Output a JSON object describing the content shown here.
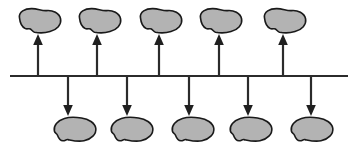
{
  "figure": {
    "title": "",
    "background_color": "#ffffff",
    "width": 360,
    "height": 150
  },
  "colors": {
    "blob_fill": "#b3b3b3",
    "blob_stroke": "#1a1a1a",
    "line_color": "#2b2b2b",
    "arrow_color": "#1f1f1f",
    "background": "#ffffff"
  },
  "axis": {
    "name": "horizontal-axis",
    "label": "",
    "x_start": 10,
    "x_end": 348,
    "y": 76,
    "thickness": 2.2
  },
  "chart_data": {
    "type": "diagram",
    "title": "",
    "xlabel": "",
    "ylabel": "",
    "grid": false,
    "legend": null,
    "nodes_above": [
      {
        "id": "above-1",
        "label": "",
        "cx": 40,
        "cy": 22,
        "rx": 21,
        "ry": 13
      },
      {
        "id": "above-2",
        "label": "",
        "cx": 100,
        "cy": 22,
        "rx": 21,
        "ry": 13
      },
      {
        "id": "above-3",
        "label": "",
        "cx": 161,
        "cy": 22,
        "rx": 21,
        "ry": 13
      },
      {
        "id": "above-4",
        "label": "",
        "cx": 221,
        "cy": 22,
        "rx": 21,
        "ry": 13
      },
      {
        "id": "above-5",
        "label": "",
        "cx": 285,
        "cy": 22,
        "rx": 21,
        "ry": 13
      }
    ],
    "nodes_below": [
      {
        "id": "below-1",
        "label": "",
        "cx": 75,
        "cy": 129,
        "rx": 21,
        "ry": 13
      },
      {
        "id": "below-2",
        "label": "",
        "cx": 132,
        "cy": 129,
        "rx": 21,
        "ry": 13
      },
      {
        "id": "below-3",
        "label": "",
        "cx": 193,
        "cy": 129,
        "rx": 21,
        "ry": 13
      },
      {
        "id": "below-4",
        "label": "",
        "cx": 251,
        "cy": 129,
        "rx": 21,
        "ry": 13
      },
      {
        "id": "below-5",
        "label": "",
        "cx": 312,
        "cy": 129,
        "rx": 21,
        "ry": 13
      }
    ],
    "arrows_up": [
      {
        "id": "arrow-up-1",
        "x": 38,
        "y_from": 76,
        "y_to": 38
      },
      {
        "id": "arrow-up-2",
        "x": 97,
        "y_from": 76,
        "y_to": 38
      },
      {
        "id": "arrow-up-3",
        "x": 159,
        "y_from": 76,
        "y_to": 38
      },
      {
        "id": "arrow-up-4",
        "x": 219,
        "y_from": 76,
        "y_to": 38
      },
      {
        "id": "arrow-up-5",
        "x": 283,
        "y_from": 76,
        "y_to": 38
      }
    ],
    "arrows_down": [
      {
        "id": "arrow-down-1",
        "x": 68,
        "y_from": 76,
        "y_to": 113
      },
      {
        "id": "arrow-down-2",
        "x": 127,
        "y_from": 76,
        "y_to": 113
      },
      {
        "id": "arrow-down-3",
        "x": 189,
        "y_from": 76,
        "y_to": 113
      },
      {
        "id": "arrow-down-4",
        "x": 248,
        "y_from": 76,
        "y_to": 113
      },
      {
        "id": "arrow-down-5",
        "x": 311,
        "y_from": 76,
        "y_to": 113
      }
    ],
    "counts": {
      "nodes_above": 5,
      "nodes_below": 5,
      "arrows_up": 5,
      "arrows_down": 5
    }
  }
}
